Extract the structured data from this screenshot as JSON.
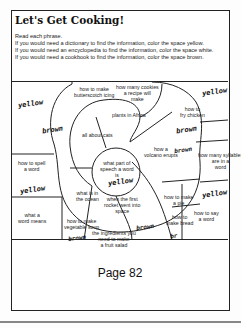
{
  "title": "Let's Get Cooking!",
  "instructions": [
    "Read each phrase.",
    "If you would need a dictionary to find the information, color the space yellow.",
    "If you would need an encyclopedia to find the information, color the space white.",
    "If you would need a cookbook to find the information, color the space brown."
  ],
  "spaces": [
    {
      "text": "how to make butterscotch icing"
    },
    {
      "text": "how many cookies a recipe will make"
    },
    {
      "text": "plants in Africa"
    },
    {
      "text": "how to fry chicken"
    },
    {
      "text": "all about cats"
    },
    {
      "text": "how to spell a word"
    },
    {
      "text": "how a volcano erupts"
    },
    {
      "text": "what part of speech a word is"
    },
    {
      "text": "how many syllables are in a word"
    },
    {
      "text": "what is in the ocean"
    },
    {
      "text": "when the first rocket went into space"
    },
    {
      "text": "how to make a pie"
    },
    {
      "text": "what a word means"
    },
    {
      "text": "how to make bread"
    },
    {
      "text": "how to say a word"
    },
    {
      "text": "how to make vegetable soup"
    },
    {
      "text": "the ingredients you need to make a fruit salad"
    }
  ],
  "handwritten": {
    "yellow_1": "yellow",
    "brown_1": "brown",
    "yellow_2": "yellow",
    "brown_2": "brown",
    "brown_3": "brown",
    "yellow_3": "yellow",
    "yellow_4": "yellow",
    "yellow_5": "yellow",
    "brown_4": "brown",
    "brown_5": "brown",
    "br_6": "br"
  },
  "footer": {
    "page_label": "Page 82"
  }
}
